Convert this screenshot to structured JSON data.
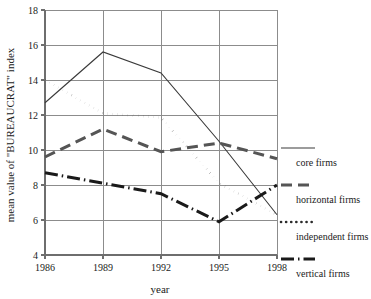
{
  "chart_data": {
    "type": "line",
    "title": "",
    "xlabel": "year",
    "ylabel": "mean value of \"BUREAUCRAT\" index",
    "x": [
      1986,
      1989,
      1992,
      1995,
      1998
    ],
    "xticklabels": [
      "1986",
      "1989",
      "1992",
      "1995",
      "1998"
    ],
    "xlim": [
      1986,
      1998
    ],
    "ylim": [
      4,
      18
    ],
    "yticks": [
      4,
      6,
      8,
      10,
      12,
      14,
      16,
      18
    ],
    "yticklabels": [
      "4",
      "6",
      "8",
      "10",
      "12",
      "14",
      "16",
      "18"
    ],
    "grid": "horizontal-and-vertical",
    "legend_position": "right",
    "series": [
      {
        "name": "core firms",
        "values": [
          12.7,
          15.6,
          14.4,
          10.5,
          6.3
        ],
        "style": "solid",
        "color": "#3a3a3a",
        "width": 1.1,
        "dasharray": "none"
      },
      {
        "name": "horizontal firms",
        "values": [
          9.6,
          11.2,
          9.9,
          10.4,
          9.5
        ],
        "style": "dashed",
        "color": "#555555",
        "width": 3.0,
        "dasharray": "11,6"
      },
      {
        "name": "independent firms",
        "values": [
          14.0,
          12.1,
          11.85,
          8.1,
          6.3
        ],
        "style": "dotted",
        "color": "#2b2b2b",
        "width": 2.6,
        "dasharray": "0.1,5"
      },
      {
        "name": "vertical firms",
        "values": [
          8.7,
          8.1,
          7.5,
          5.9,
          8.0
        ],
        "style": "dash-dot",
        "color": "#1a1a1a",
        "width": 3.0,
        "dasharray": "13,4,1.5,4"
      }
    ]
  },
  "legend": {
    "items": [
      {
        "label": "core firms",
        "swatch": "solid-line-swatch"
      },
      {
        "label": "horizontal firms",
        "swatch": "dashed-line-swatch"
      },
      {
        "label": "independent firms",
        "swatch": "dotted-line-swatch"
      },
      {
        "label": "vertical firms",
        "swatch": "dash-dot-line-swatch"
      }
    ]
  }
}
